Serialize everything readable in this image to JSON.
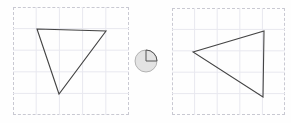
{
  "canvas": {
    "width": 291,
    "height": 123,
    "background_color": "#fefefe"
  },
  "style": {
    "panel_border_color": "#c9c9d2",
    "grid_line_color": "#e8e8ef",
    "shape_stroke_color": "#444444",
    "shape_stroke_width": 1.1,
    "indicator_fill_color": "#e3e3e3",
    "indicator_stroke_color": "#9a9a9a",
    "indicator_marker_color": "#555555"
  },
  "panels": [
    {
      "id": "source-panel",
      "role": "before",
      "label": "Original shape panel",
      "bounds": {
        "x": 13,
        "y": 7,
        "width": 116,
        "height": 108
      },
      "grid": {
        "columns": 5,
        "rows": 5,
        "cell_width": 23.2,
        "cell_height": 21.6
      },
      "shape": {
        "name": "triangle",
        "label": "Downward-pointing triangle",
        "orientation": "apex-down",
        "points": [
          {
            "x": 37,
            "y": 29
          },
          {
            "x": 106,
            "y": 31
          },
          {
            "x": 59,
            "y": 94
          }
        ]
      }
    },
    {
      "id": "result-panel",
      "role": "after",
      "label": "Transformed shape panel",
      "bounds": {
        "x": 172,
        "y": 8,
        "width": 113,
        "height": 107
      },
      "grid": {
        "columns": 5,
        "rows": 5,
        "cell_width": 22.6,
        "cell_height": 21.4
      },
      "shape": {
        "name": "triangle",
        "label": "Left-pointing triangle",
        "orientation": "apex-left",
        "points": [
          {
            "x": 193,
            "y": 52
          },
          {
            "x": 264,
            "y": 31
          },
          {
            "x": 263,
            "y": 97
          }
        ]
      }
    }
  ],
  "indicator": {
    "id": "rotation-indicator",
    "label": "quarter-turn rotation indicator",
    "center": {
      "x": 146,
      "y": 61
    },
    "radius": 11,
    "marked_quadrant": "upper-right",
    "angle_degrees": 90,
    "direction": "counterclockwise",
    "spokes": [
      {
        "from": "center",
        "to": "top"
      },
      {
        "from": "center",
        "to": "right"
      }
    ]
  },
  "accessibility": {
    "figure_description": "Two dashed grid panels separated by a small shaded circle marked with a quarter arc, showing a triangle rotated a quarter turn."
  }
}
